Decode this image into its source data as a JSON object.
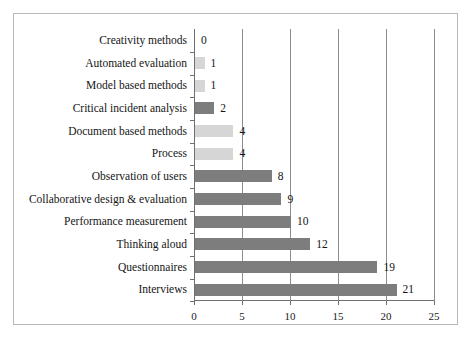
{
  "chart_data": {
    "type": "bar",
    "orientation": "horizontal",
    "title": "",
    "xlabel": "",
    "ylabel": "",
    "xlim": [
      0,
      25
    ],
    "xticks": [
      0,
      5,
      10,
      15,
      20,
      25
    ],
    "grid": "vertical",
    "legend": "none",
    "colors": {
      "dark": "#7d7d7d",
      "light": "#d6d6d6",
      "border": "#b9b9b9",
      "axis": "#6f6f6f",
      "gridline": "#8c8c8c",
      "text": "#151515"
    },
    "categories": [
      "Creativity methods",
      "Automated evaluation",
      "Model based methods",
      "Critical incident analysis",
      "Document based methods",
      "Process",
      "Observation of users",
      "Collaborative design & evaluation",
      "Performance measurement",
      "Thinking aloud",
      "Questionnaires",
      "Interviews"
    ],
    "values": [
      0,
      1,
      1,
      2,
      4,
      4,
      8,
      9,
      10,
      12,
      19,
      21
    ],
    "bar_shades": [
      "light",
      "light",
      "light",
      "dark",
      "light",
      "light",
      "dark",
      "dark",
      "dark",
      "dark",
      "dark",
      "dark"
    ],
    "value_labels": [
      "0",
      "1",
      "1",
      "2",
      "4",
      "4",
      "8",
      "9",
      "10",
      "12",
      "19",
      "21"
    ],
    "xtick_labels": [
      "0",
      "5",
      "10",
      "15",
      "20",
      "25"
    ]
  }
}
